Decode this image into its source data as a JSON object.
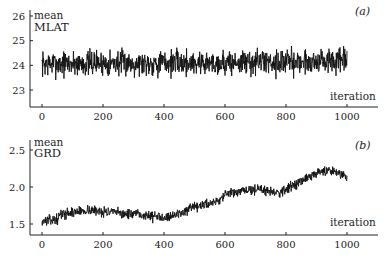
{
  "chart_data": [
    {
      "type": "line",
      "panel_label": "(a)",
      "title": "",
      "ylabel_line1": "mean",
      "ylabel_line2": "MLAT",
      "xlabel": "iteration",
      "xlim": [
        0,
        1000
      ],
      "ylim": [
        22.4,
        26.2
      ],
      "xticks": [
        0,
        200,
        400,
        600,
        800,
        1000
      ],
      "yticks": [
        23,
        24,
        25,
        26
      ],
      "grid": false,
      "legend": "none",
      "series_description": "Noisy trace fluctuating around a mean of ~24.1 with range roughly 23.0–25.6 across 1000 iterations; no trend.",
      "trend": [
        [
          0,
          24.05
        ],
        [
          200,
          24.1
        ],
        [
          400,
          24.1
        ],
        [
          600,
          24.1
        ],
        [
          800,
          24.15
        ],
        [
          1000,
          24.15
        ]
      ],
      "noise_amplitude": 0.35,
      "min": 22.9,
      "max": 25.6,
      "seed": 7
    },
    {
      "type": "line",
      "panel_label": "(b)",
      "title": "",
      "ylabel_line1": "mean",
      "ylabel_line2": "GRD",
      "xlabel": "iteration",
      "xlim": [
        0,
        1000
      ],
      "ylim": [
        1.35,
        2.65
      ],
      "xticks": [
        0,
        200,
        400,
        600,
        800,
        1000
      ],
      "yticks": [
        1.5,
        2.0,
        2.5
      ],
      "grid": false,
      "legend": "none",
      "series_description": "Noisy trace starting ~1.55, rising to ~1.68 by iteration 150, dipping to ~1.6 near 400, then climbing steadily to ~2.25 around 950 and ending near 2.15.",
      "trend": [
        [
          0,
          1.54
        ],
        [
          50,
          1.56
        ],
        [
          60,
          1.63
        ],
        [
          150,
          1.69
        ],
        [
          250,
          1.65
        ],
        [
          380,
          1.6
        ],
        [
          420,
          1.6
        ],
        [
          500,
          1.72
        ],
        [
          580,
          1.82
        ],
        [
          600,
          1.9
        ],
        [
          700,
          1.97
        ],
        [
          780,
          1.93
        ],
        [
          850,
          2.08
        ],
        [
          920,
          2.22
        ],
        [
          960,
          2.22
        ],
        [
          1000,
          2.14
        ]
      ],
      "noise_amplitude": 0.045,
      "min": 1.48,
      "max": 2.5,
      "seed": 13
    }
  ],
  "panels": [
    {
      "label": "(a)",
      "ylabel1": "mean",
      "ylabel2": "MLAT",
      "xlabel": "iteration"
    },
    {
      "label": "(b)",
      "ylabel1": "mean",
      "ylabel2": "GRD",
      "xlabel": "iteration"
    }
  ]
}
